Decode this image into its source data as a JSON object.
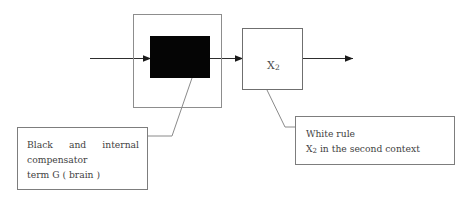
{
  "diagram": {
    "title_text": "",
    "background_color": "#ffffff",
    "line_color": "#4a4a4a",
    "black_block_color": "#050505",
    "box_border_color": "#7d7d7d",
    "blocks": {
      "outer_block": {
        "label": "",
        "name": "outer-container-block"
      },
      "black_block": {
        "label": "",
        "name": "black-filled-block"
      },
      "white_block": {
        "label": "X",
        "subscript": "2",
        "name": "white-rule-block"
      }
    },
    "arrows": [
      {
        "name": "input-arrow",
        "label": ""
      },
      {
        "name": "middle-arrow",
        "label": ""
      },
      {
        "name": "output-arrow",
        "label": ""
      }
    ],
    "captions": {
      "left": {
        "line1": "Black and internal",
        "line2": "compensator",
        "line3": "term G ( brain )"
      },
      "right": {
        "line1": "White rule",
        "line2_prefix": "X",
        "line2_subscript": "2",
        "line2_suffix": " in the second context"
      }
    }
  }
}
